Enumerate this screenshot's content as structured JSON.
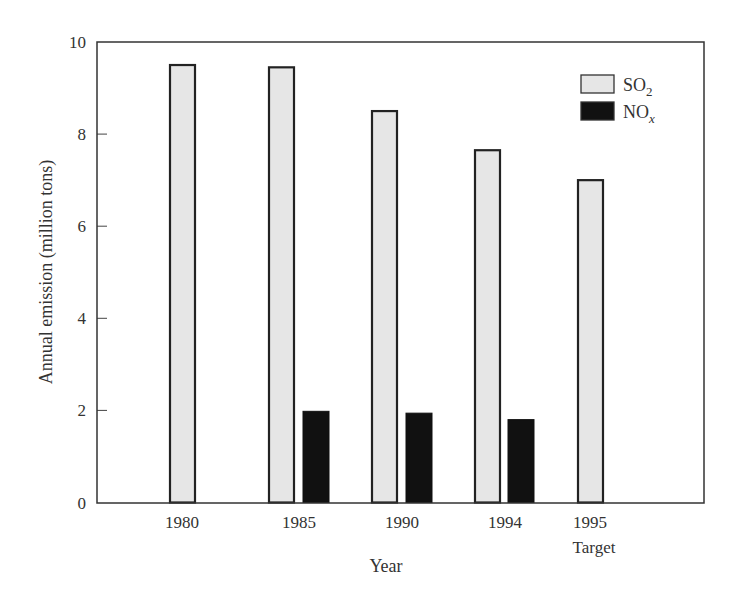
{
  "chart_data": {
    "type": "bar",
    "title": "",
    "xlabel": "Year",
    "ylabel": "Annual emission (million tons)",
    "ylim": [
      0,
      10
    ],
    "yticks": [
      0,
      2,
      4,
      6,
      8,
      10
    ],
    "grid": false,
    "legend_position": "upper right (inside plot)",
    "categories": [
      "1980",
      "1985",
      "1990",
      "1994",
      "1995"
    ],
    "category_sublabels": [
      "",
      "",
      "",
      "",
      "Target"
    ],
    "series": [
      {
        "name": "SO2",
        "label_main": "SO",
        "label_sub": "2",
        "color": "#e6e6e6",
        "values": [
          9.5,
          9.45,
          8.5,
          7.65,
          7.0
        ]
      },
      {
        "name": "NOx",
        "label_main": "NO",
        "label_sub": "x",
        "color": "#111111",
        "values": [
          null,
          1.98,
          1.94,
          1.8,
          null
        ]
      }
    ]
  }
}
